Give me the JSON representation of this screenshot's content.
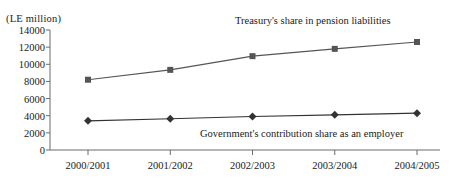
{
  "chart_data": {
    "type": "line",
    "title": "",
    "unit_label": "(LE million)",
    "xlabel": "",
    "ylabel": "",
    "ylim": [
      0,
      14000
    ],
    "ytick_step": 2000,
    "yticks": [
      "0",
      "2000",
      "4000",
      "6000",
      "8000",
      "10000",
      "12000",
      "14000"
    ],
    "ytick_values": [
      0,
      2000,
      4000,
      6000,
      8000,
      10000,
      12000,
      14000
    ],
    "grid": false,
    "legend_position": "inline-annotation",
    "categories": [
      "2000/2001",
      "2001/2002",
      "2002/2003",
      "2003/2004",
      "2004/2005"
    ],
    "series": [
      {
        "name": "Treasury's share in pension liabilities",
        "marker": "square",
        "color": "#555555",
        "values": [
          8200,
          9350,
          10950,
          11800,
          12600
        ]
      },
      {
        "name": "Government's contribution share as an employer",
        "marker": "diamond",
        "color": "#333333",
        "values": [
          3400,
          3650,
          3900,
          4100,
          4300
        ]
      }
    ],
    "annotations": [
      {
        "text": "Treasury's share in pension liabilities",
        "series": 0
      },
      {
        "text": "Government's contribution share as an employer",
        "series": 1
      }
    ]
  },
  "colors": {
    "axis": "#6b6b6b",
    "text": "#1a1a1a",
    "series_treasury": "#555555",
    "series_government": "#333333"
  }
}
